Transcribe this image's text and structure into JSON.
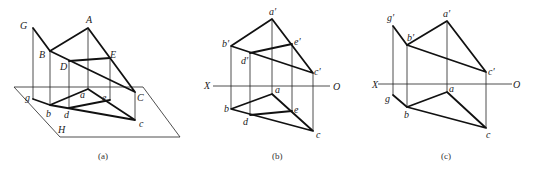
{
  "figures": [
    {
      "id": "a",
      "caption": "(a)",
      "description": "Pictorial view of triangle ABC with points D, E and vertical line G projected onto the horizontal plane H",
      "points_space": {
        "A": "A",
        "B": "B",
        "C": "C",
        "D": "D",
        "E": "E",
        "G": "G"
      },
      "points_h": {
        "a": "a",
        "b": "b",
        "c": "c",
        "d": "d",
        "e": "e",
        "g": "g"
      },
      "plane_label": "H"
    },
    {
      "id": "b",
      "caption": "(b)",
      "description": "Orthographic projection of triangle ABC with line DE, front view above X-O axis, top view below",
      "points_v": {
        "a": "a′",
        "b": "b′",
        "c": "c′",
        "d": "d′",
        "e": "e′"
      },
      "points_h": {
        "a": "a",
        "b": "b",
        "c": "c",
        "d": "d",
        "e": "e"
      },
      "axis": {
        "left": "X",
        "right": "O"
      }
    },
    {
      "id": "c",
      "caption": "(c)",
      "description": "Orthographic projection of triangle ABC with line GB",
      "points_v": {
        "g": "g′",
        "a": "a′",
        "b": "b′",
        "c": "c′"
      },
      "points_h": {
        "g": "g",
        "a": "a",
        "b": "b",
        "c": "c"
      },
      "axis": {
        "left": "X",
        "right": "O"
      }
    }
  ]
}
